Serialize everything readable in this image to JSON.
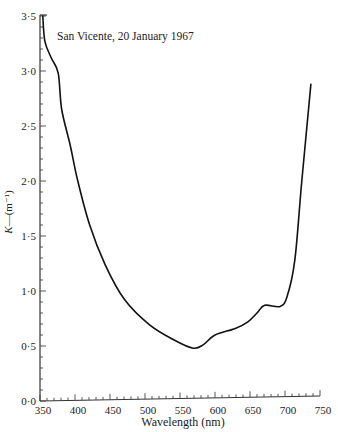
{
  "chart_data": {
    "type": "line",
    "title": "",
    "annotation": "San Vicente, 20 January 1967",
    "xlabel": "Wavelength (nm)",
    "ylabel": "K—(m⁻¹)",
    "xlim": [
      350,
      750
    ],
    "ylim": [
      0.0,
      3.5
    ],
    "x_ticks": [
      "350",
      "400",
      "450",
      "500",
      "550",
      "600",
      "650",
      "700",
      "750"
    ],
    "y_ticks": [
      "0·0",
      "0·5",
      "1·0",
      "1·5",
      "2·0",
      "2·5",
      "3·0",
      "3·5"
    ],
    "grid": false,
    "legend": null,
    "series": [
      {
        "name": "K",
        "x": [
          354,
          357,
          366,
          376,
          381,
          393,
          404,
          421,
          443,
          471,
          507,
          543,
          569,
          583,
          600,
          629,
          647,
          660,
          671,
          693,
          703,
          714,
          724,
          737
        ],
        "y": [
          3.5,
          3.27,
          3.12,
          2.98,
          2.65,
          2.33,
          2.0,
          1.6,
          1.24,
          0.92,
          0.69,
          0.55,
          0.48,
          0.51,
          0.6,
          0.66,
          0.72,
          0.8,
          0.87,
          0.86,
          0.95,
          1.28,
          2.0,
          2.88
        ]
      }
    ]
  }
}
